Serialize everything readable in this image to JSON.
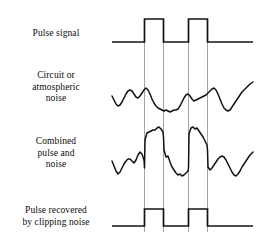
{
  "figure": {
    "background_color": "#ffffff",
    "trace_color": "#121212",
    "guide_color": "#9a9a9a",
    "width": 272,
    "height": 237
  },
  "rows": [
    {
      "id": "pulse-signal",
      "label": "Pulse signal",
      "label_x": 4,
      "label_y": 28,
      "baseline_y": 42,
      "top_y": 19,
      "trace_start_x": 112,
      "trace_end_x": 253
    },
    {
      "id": "circuit-noise",
      "label": "Circuit or\natmospheric\nnoise",
      "label_x": 4,
      "label_y": 70,
      "baseline_y": 99,
      "trace_start_x": 112,
      "trace_end_x": 253
    },
    {
      "id": "combined-pulse-noise",
      "label": "Combined\npulse and\nnoise",
      "label_x": 4,
      "label_y": 136,
      "baseline_y": 166,
      "trace_start_x": 112,
      "trace_end_x": 253
    },
    {
      "id": "pulse-recovered",
      "label": "Pulse recovered\nby clipping noise",
      "label_x": 4,
      "label_y": 205,
      "baseline_y": 226,
      "top_y": 209,
      "trace_start_x": 112,
      "trace_end_x": 253
    }
  ],
  "guides": {
    "x_positions": [
      144.5,
      163.5,
      188.5,
      207.5
    ],
    "y_top": 19,
    "y_bottom": 232
  },
  "chart_data": {
    "type": "line",
    "xlabel": "",
    "ylabel": "",
    "grid": false,
    "legend_position": "left-labels",
    "pulse_edges": {
      "pulse_1_rise_x": 144.5,
      "pulse_1_fall_x": 163.5,
      "pulse_2_rise_x": 188.5,
      "pulse_2_fall_x": 207.5
    },
    "series": [
      {
        "name": "Pulse signal",
        "path": "M112,42 L144.5,42 L144.5,19 L163.5,19 L163.5,42 L188.5,42 L188.5,19 L207.5,19 L207.5,42 L253,42"
      },
      {
        "name": "Circuit or atmospheric noise",
        "path": "M112,96 L114,100 L116,104 L118,106 L120,105 L122,102 L124,98 L126,94 L128,91 L130,90 L132,91 L134,94 L136,97 L138,98 L140,96 L142,93 L144,90 L146,88 L148,90 L150,94 L152,99 L154,103 L156,106 L158,108 L160,109 L162,110 L164,111 L166,110 L168,111 L170,112 L172,111 L174,110 L176,110 L178,109 L180,106 L182,102 L184,98 L186,95 L188,94 L190,96 L192,99 L194,101 L196,100 L198,99 L200,98 L202,97 L204,96 L206,95 L208,93 L210,91 L212,89 L214,88 L216,90 L218,94 L220,99 L222,104 L224,108 L226,110 L228,111 L230,110 L232,107 L234,104 L236,101 L238,98 L240,95 L242,92 L244,90 L246,88 L248,86 L250,84 L253,82"
      },
      {
        "name": "Combined pulse and noise",
        "path": "M112,161 L114,166 L116,171 L118,174 L120,172 L122,168 L124,164 L126,161 L128,159 L130,159 L132,161 L134,163 L136,160 L138,155 L140,152 L142,154 L144,160 L144.5,168 L145,140 L147,133 L149,132 L151,131 L153,130 L155,130 L157,128 L159,127 L161,129 L163,132 L163.5,137 L164,150 L166,157 L168,156 L170,162 L172,167 L174,170 L176,173 L178,175 L180,174 L182,176 L184,175 L186,173 L188,171 L188.5,168 L189,134 L191,128 L193,127 L195,129 L197,128 L199,131 L201,134 L203,137 L205,141 L207,145 L207.5,150 L208,167 L210,170 L212,168 L214,165 L216,162 L218,159 L220,157 L222,156 L224,157 L226,160 L228,164 L230,168 L232,172 L234,175 L236,176 L238,174 L240,171 L242,167 L244,164 L246,161 L248,158 L250,155 L253,152"
      },
      {
        "name": "Pulse recovered by clipping noise",
        "path": "M112,226 L144.5,226 L144.5,209 L163.5,209 L163.5,226 L188.5,226 L188.5,209 L207.5,209 L207.5,226 L253,226"
      }
    ]
  }
}
